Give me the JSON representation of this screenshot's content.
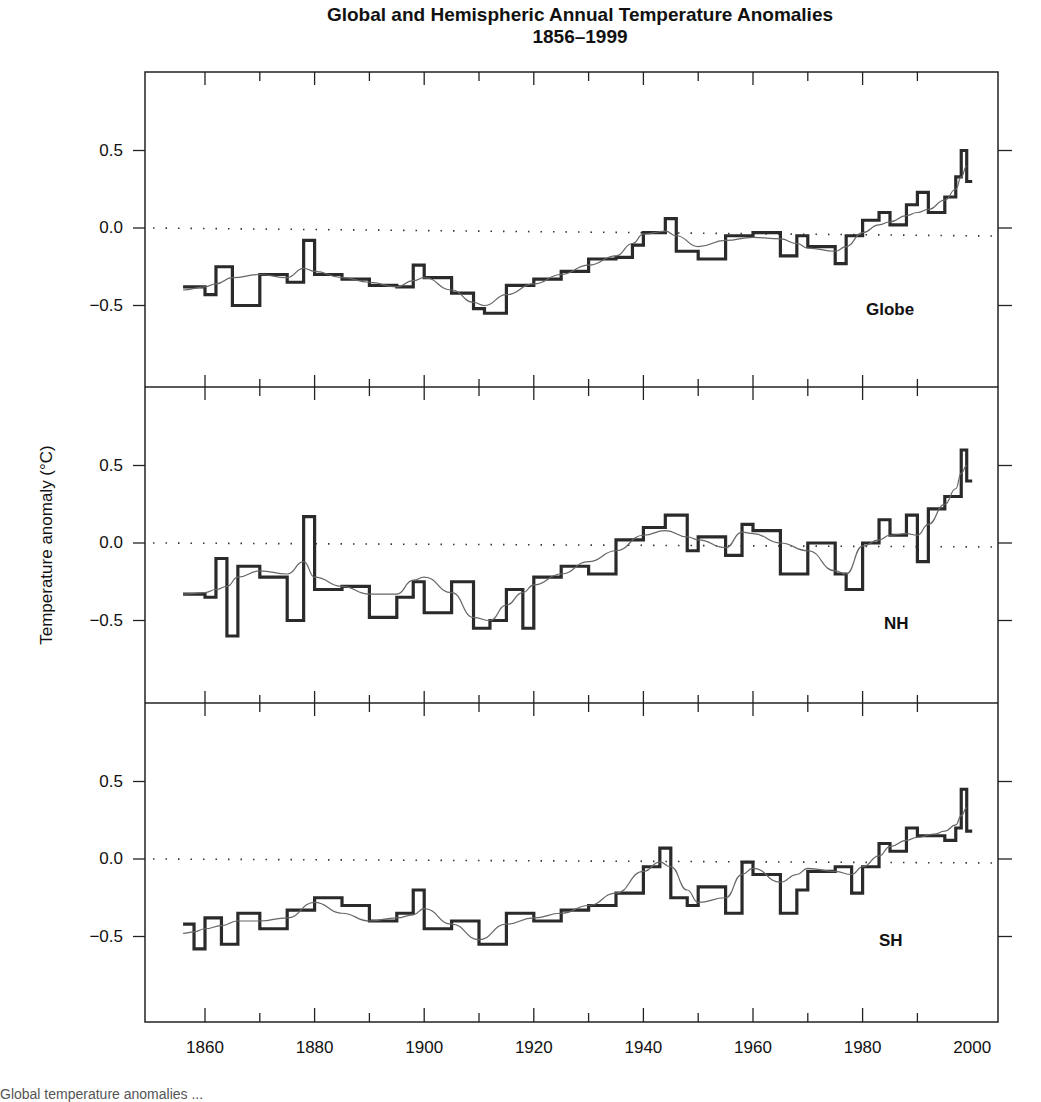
{
  "title_line1": "Global and Hemispheric Annual Temperature Anomalies",
  "title_line2": "1856–1999",
  "caption": "Global temperature anomalies ...",
  "chart_data": {
    "type": "line",
    "title": "Global and Hemispheric Annual Temperature Anomalies 1856–1999",
    "xlabel": "",
    "ylabel": "Temperature anomaly (°C)",
    "xlim": [
      1852,
      2002
    ],
    "x_ticks": [
      1860,
      1880,
      1900,
      1920,
      1940,
      1960,
      1980,
      2000
    ],
    "x_tick_labels": [
      "1860",
      "1880",
      "1900",
      "1920",
      "1940",
      "1960",
      "1980",
      "2000"
    ],
    "y_ticks": [
      -0.5,
      0.0,
      0.5
    ],
    "y_tick_labels": [
      "−0.5",
      "0.0",
      "0.5"
    ],
    "ylim": [
      -1.0,
      1.0
    ],
    "reference_line": {
      "y": 0.0,
      "style": "dotted"
    },
    "grid": false,
    "legend": null,
    "panels": [
      {
        "name": "Globe",
        "label": "Globe",
        "annual_style": "step (thick)",
        "smoothed_style": "thin curve",
        "x": [
          1856,
          1860,
          1862,
          1865,
          1870,
          1875,
          1878,
          1880,
          1885,
          1890,
          1895,
          1898,
          1900,
          1905,
          1909,
          1911,
          1915,
          1920,
          1925,
          1930,
          1935,
          1938,
          1940,
          1944,
          1946,
          1950,
          1955,
          1960,
          1965,
          1968,
          1970,
          1975,
          1977,
          1980,
          1983,
          1985,
          1988,
          1990,
          1992,
          1995,
          1997,
          1998,
          1999
        ],
        "annual": [
          -0.38,
          -0.43,
          -0.25,
          -0.5,
          -0.3,
          -0.35,
          -0.08,
          -0.3,
          -0.33,
          -0.37,
          -0.38,
          -0.24,
          -0.32,
          -0.42,
          -0.52,
          -0.55,
          -0.37,
          -0.33,
          -0.28,
          -0.2,
          -0.19,
          -0.11,
          -0.03,
          0.06,
          -0.15,
          -0.2,
          -0.05,
          -0.03,
          -0.18,
          -0.05,
          -0.12,
          -0.23,
          -0.05,
          0.05,
          0.1,
          0.02,
          0.15,
          0.23,
          0.1,
          0.2,
          0.33,
          0.5,
          0.3
        ],
        "smoothed": [
          -0.4,
          -0.38,
          -0.36,
          -0.32,
          -0.3,
          -0.32,
          -0.26,
          -0.28,
          -0.32,
          -0.35,
          -0.38,
          -0.34,
          -0.32,
          -0.4,
          -0.48,
          -0.5,
          -0.43,
          -0.36,
          -0.3,
          -0.24,
          -0.18,
          -0.1,
          -0.04,
          -0.02,
          -0.05,
          -0.12,
          -0.08,
          -0.06,
          -0.07,
          -0.1,
          -0.13,
          -0.15,
          -0.12,
          -0.03,
          0.02,
          0.04,
          0.08,
          0.1,
          0.12,
          0.18,
          0.25,
          0.33,
          0.4
        ]
      },
      {
        "name": "NH",
        "label": "NH",
        "annual_style": "step (thick)",
        "smoothed_style": "thin curve",
        "x": [
          1856,
          1860,
          1862,
          1864,
          1866,
          1870,
          1875,
          1878,
          1880,
          1885,
          1890,
          1895,
          1898,
          1900,
          1905,
          1909,
          1912,
          1915,
          1918,
          1920,
          1925,
          1930,
          1935,
          1940,
          1944,
          1948,
          1950,
          1955,
          1958,
          1960,
          1965,
          1970,
          1975,
          1977,
          1980,
          1983,
          1985,
          1988,
          1990,
          1992,
          1995,
          1997,
          1998,
          1999
        ],
        "annual": [
          -0.33,
          -0.35,
          -0.1,
          -0.6,
          -0.15,
          -0.22,
          -0.5,
          0.17,
          -0.3,
          -0.28,
          -0.48,
          -0.35,
          -0.25,
          -0.45,
          -0.25,
          -0.55,
          -0.5,
          -0.3,
          -0.55,
          -0.22,
          -0.15,
          -0.2,
          0.02,
          0.1,
          0.18,
          -0.05,
          0.04,
          -0.08,
          0.12,
          0.08,
          -0.2,
          0.0,
          -0.2,
          -0.3,
          0.0,
          0.15,
          0.05,
          0.18,
          -0.12,
          0.22,
          0.3,
          0.3,
          0.6,
          0.4
        ],
        "smoothed": [
          -0.33,
          -0.32,
          -0.3,
          -0.28,
          -0.22,
          -0.18,
          -0.2,
          -0.12,
          -0.22,
          -0.28,
          -0.33,
          -0.33,
          -0.24,
          -0.22,
          -0.32,
          -0.48,
          -0.5,
          -0.4,
          -0.32,
          -0.27,
          -0.2,
          -0.12,
          -0.05,
          0.05,
          0.08,
          0.04,
          0.02,
          -0.03,
          0.07,
          0.06,
          0.0,
          -0.05,
          -0.18,
          -0.2,
          -0.02,
          0.02,
          0.05,
          0.06,
          0.05,
          0.12,
          0.25,
          0.35,
          0.45,
          0.5
        ]
      },
      {
        "name": "SH",
        "label": "SH",
        "annual_style": "step (thick)",
        "smoothed_style": "thin curve",
        "x": [
          1856,
          1858,
          1860,
          1863,
          1866,
          1870,
          1875,
          1880,
          1885,
          1890,
          1895,
          1898,
          1900,
          1905,
          1910,
          1915,
          1920,
          1925,
          1930,
          1935,
          1940,
          1943,
          1945,
          1948,
          1950,
          1955,
          1958,
          1960,
          1965,
          1968,
          1970,
          1975,
          1978,
          1980,
          1983,
          1985,
          1988,
          1990,
          1993,
          1995,
          1997,
          1998,
          1999
        ],
        "annual": [
          -0.42,
          -0.58,
          -0.38,
          -0.55,
          -0.35,
          -0.45,
          -0.33,
          -0.25,
          -0.3,
          -0.4,
          -0.35,
          -0.2,
          -0.45,
          -0.4,
          -0.55,
          -0.35,
          -0.4,
          -0.33,
          -0.3,
          -0.22,
          -0.05,
          0.07,
          -0.25,
          -0.3,
          -0.18,
          -0.35,
          -0.02,
          -0.1,
          -0.35,
          -0.2,
          -0.08,
          -0.05,
          -0.22,
          -0.05,
          0.1,
          0.05,
          0.2,
          0.15,
          0.15,
          0.12,
          0.2,
          0.45,
          0.18
        ],
        "smoothed": [
          -0.48,
          -0.47,
          -0.45,
          -0.43,
          -0.4,
          -0.4,
          -0.38,
          -0.28,
          -0.35,
          -0.4,
          -0.38,
          -0.36,
          -0.32,
          -0.42,
          -0.52,
          -0.42,
          -0.38,
          -0.35,
          -0.3,
          -0.22,
          -0.08,
          -0.02,
          -0.05,
          -0.2,
          -0.28,
          -0.25,
          -0.1,
          -0.06,
          -0.15,
          -0.1,
          -0.06,
          -0.08,
          -0.1,
          -0.05,
          0.02,
          0.08,
          0.12,
          0.14,
          0.16,
          0.18,
          0.22,
          0.28,
          0.33
        ]
      }
    ]
  }
}
